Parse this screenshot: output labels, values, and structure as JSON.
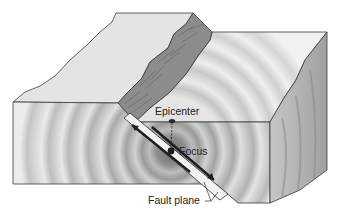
{
  "figure": {
    "labels": {
      "epicenter": "Epicenter",
      "focus": "Focus",
      "fault_plane": "Fault plane"
    },
    "colors": {
      "background": "#ffffff",
      "surface": "#e6e6e6",
      "scarp": "#8a8a8a",
      "side_face": "#b4b4b4",
      "outline": "#3a3a3a",
      "wave_dark": "#9a9a9a",
      "wave_light": "#ededed",
      "focus_dot": "#1e1e1e"
    },
    "elements": [
      "top surface (upthrown block)",
      "fault scarp",
      "front cross-section with seismic wave rings",
      "right side face",
      "fault plane with slip arrows",
      "focus point",
      "epicenter point"
    ]
  }
}
